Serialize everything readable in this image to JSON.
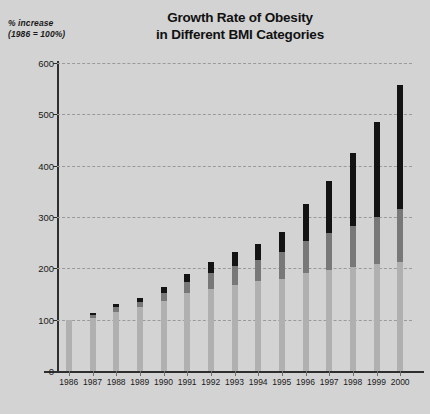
{
  "chart_data": {
    "type": "bar",
    "stacked": true,
    "title": "Growth Rate of Obesity in Different BMI Categories",
    "title_line1": "Growth Rate of Obesity",
    "title_line2": "in Different BMI Categories",
    "ylabel_line1": "% increase",
    "ylabel_line2": "(1986 = 100%)",
    "xlabel": "",
    "ylim": [
      0,
      600
    ],
    "yticks": [
      0,
      100,
      200,
      300,
      400,
      500,
      600
    ],
    "ytick_labels": [
      "0",
      "100",
      "200",
      "300",
      "400",
      "500",
      "600"
    ],
    "grid": true,
    "legend": "none",
    "categories": [
      "1986",
      "1987",
      "1988",
      "1989",
      "1990",
      "1991",
      "1992",
      "1993",
      "1994",
      "1995",
      "1996",
      "1997",
      "1998",
      "1999",
      "2000"
    ],
    "series": [
      {
        "name": "lower BMI category",
        "color": "#b0b0b0",
        "values": [
          100,
          104,
          115,
          124,
          136,
          152,
          160,
          168,
          175,
          180,
          190,
          196,
          203,
          208,
          212
        ]
      },
      {
        "name": "middle BMI category",
        "color": "#787878",
        "values": [
          0,
          5,
          9,
          11,
          16,
          22,
          30,
          36,
          42,
          52,
          63,
          72,
          80,
          92,
          104
        ]
      },
      {
        "name": "higher BMI category",
        "color": "#131313",
        "values": [
          0,
          4,
          6,
          7,
          11,
          16,
          22,
          27,
          31,
          38,
          72,
          102,
          142,
          186,
          241
        ]
      }
    ],
    "totals": [
      100,
      113,
      130,
      142,
      163,
      190,
      212,
      231,
      248,
      270,
      325,
      370,
      425,
      486,
      557
    ]
  },
  "colors": {
    "background": "#d3d3d3",
    "axis": "#2e2e2e",
    "gridline": "#9a9a9a",
    "text": "#1a1a1a"
  }
}
